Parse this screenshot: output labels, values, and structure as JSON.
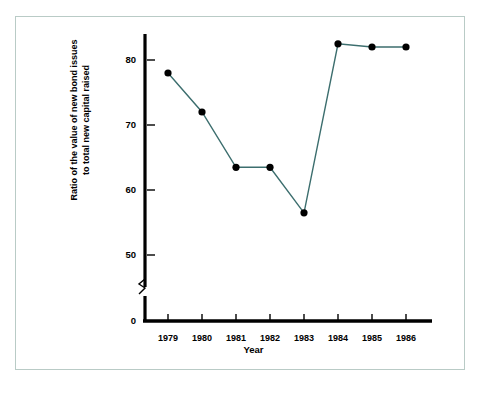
{
  "figure": {
    "border_color": "#b9cbc6",
    "background": "#ffffff"
  },
  "chart_data": {
    "type": "line",
    "title": "",
    "xlabel": "Year",
    "ylabel_line1": "Ratio of the value of new bond issues",
    "ylabel_line2": "to total new capital raised",
    "categories": [
      "1979",
      "1980",
      "1981",
      "1982",
      "1983",
      "1984",
      "1985",
      "1986"
    ],
    "values": [
      78,
      72,
      63.5,
      63.5,
      56.5,
      82.5,
      82,
      82
    ],
    "x": [
      1979,
      1980,
      1981,
      1982,
      1983,
      1984,
      1985,
      1986
    ],
    "yticks": [
      "0",
      "50",
      "60",
      "70",
      "80"
    ],
    "ytick_values": [
      0,
      50,
      60,
      70,
      80
    ],
    "ylim": [
      50,
      85
    ],
    "axis_break": true,
    "axis_break_note": "y-axis broken between 0 and 50",
    "grid": false,
    "legend": "none",
    "line_color": "#3c6e6e",
    "marker_color": "#000000",
    "marker": "circle",
    "axis_color": "#000000"
  }
}
